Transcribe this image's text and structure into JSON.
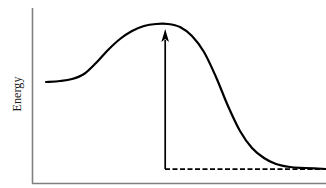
{
  "figure": {
    "width": 326,
    "height": 188,
    "background": "#ffffff"
  },
  "axes": {
    "y_label": "Energy",
    "x_label": "",
    "line_color": "#808080",
    "y_axis_x": 32,
    "y_axis_top": 8,
    "x_axis_y": 183,
    "x_axis_right": 326
  },
  "chart_data": {
    "type": "line",
    "title": "",
    "xlabel": "",
    "ylabel": "Energy",
    "grid": false,
    "legend": null,
    "xlim": [
      0,
      1
    ],
    "ylim": [
      0,
      1
    ],
    "series": [
      {
        "name": "energy-profile",
        "style": "solid",
        "color": "#000000",
        "width": 2.2,
        "description": "Reaction energy profile: flat reactant plateau rising through a transition state maximum then falling to a lower product plateau",
        "points": [
          [
            46,
            82
          ],
          [
            60,
            81
          ],
          [
            72,
            79
          ],
          [
            84,
            74
          ],
          [
            96,
            63
          ],
          [
            108,
            50
          ],
          [
            120,
            39
          ],
          [
            132,
            31
          ],
          [
            144,
            26
          ],
          [
            156,
            24
          ],
          [
            168,
            24
          ],
          [
            180,
            27
          ],
          [
            192,
            36
          ],
          [
            204,
            52
          ],
          [
            216,
            77
          ],
          [
            228,
            106
          ],
          [
            240,
            131
          ],
          [
            252,
            148
          ],
          [
            264,
            158
          ],
          [
            276,
            164
          ],
          [
            290,
            167
          ],
          [
            305,
            168
          ],
          [
            326,
            169
          ]
        ]
      }
    ],
    "annotations": [
      {
        "name": "activation-energy-arrow",
        "type": "arrow",
        "direction": "up",
        "x": 165,
        "y_tail": 169,
        "y_head": 29,
        "color": "#000000",
        "label": ""
      },
      {
        "name": "product-level-dashed-line",
        "type": "dashed-line",
        "y": 169,
        "x_start": 165,
        "x_end": 326,
        "color": "#000000",
        "dash": "5 2.5",
        "label": ""
      }
    ]
  }
}
